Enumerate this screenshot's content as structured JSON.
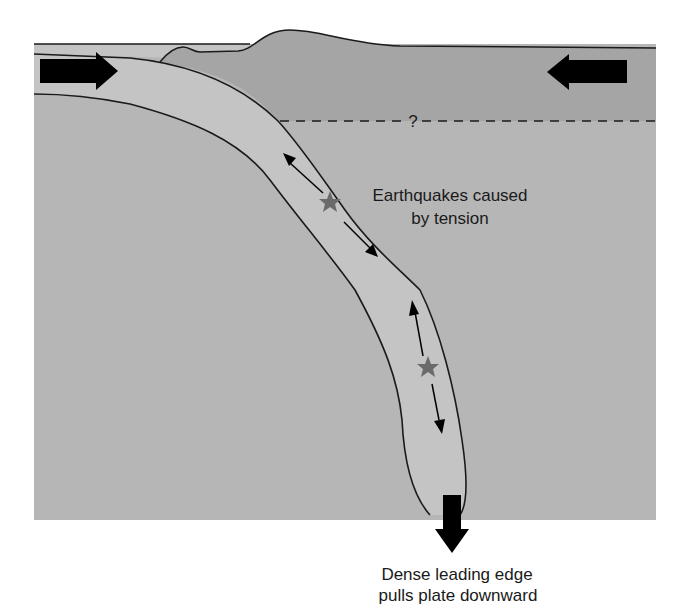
{
  "diagram": {
    "type": "subduction-zone-cross-section",
    "labels": {
      "tension": {
        "line1": "Earthquakes caused",
        "line2": "by tension"
      },
      "slab_pull": {
        "line1": "Dense leading edge",
        "line2": "pulls plate downward"
      },
      "unknown_boundary": "?"
    },
    "icons": {
      "left_arrow": "arrow-right-icon",
      "right_arrow": "arrow-left-icon",
      "down_arrow": "arrow-down-icon",
      "earthquake_markers": "star-icon"
    },
    "colors": {
      "background": "#ffffff",
      "ocean_and_slab": "#c4c4c4",
      "mantle": "#b6b6b6",
      "overriding_plate": "#a5a5a5",
      "outline": "#1a1a1a",
      "arrow": "#000000",
      "star": "#6a6a6a"
    },
    "earthquakes": [
      {
        "name": "upper",
        "x": 330,
        "y": 203
      },
      {
        "name": "lower",
        "x": 428,
        "y": 368
      }
    ]
  }
}
